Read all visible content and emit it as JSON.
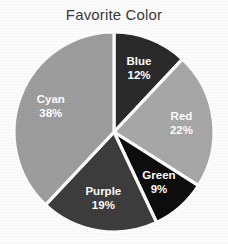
{
  "chart_data": {
    "type": "pie",
    "title": "Favorite Color",
    "xlabel": "",
    "ylabel": "",
    "legend": "none",
    "grid": false,
    "start_angle_deg": 0,
    "direction": "clockwise",
    "categories": [
      "Blue",
      "Red",
      "Green",
      "Purple",
      "Cyan"
    ],
    "values": [
      12,
      22,
      9,
      19,
      38
    ],
    "value_unit": "%",
    "slices": [
      {
        "label": "Blue",
        "value": 12,
        "value_text": "12%",
        "color": "#2a2a2a",
        "label_color": "#ffffff"
      },
      {
        "label": "Red",
        "value": 22,
        "value_text": "22%",
        "color": "#a8a8a8",
        "label_color": "#ffffff"
      },
      {
        "label": "Green",
        "value": 9,
        "value_text": "9%",
        "color": "#0d0d0d",
        "label_color": "#ffffff"
      },
      {
        "label": "Purple",
        "value": 19,
        "value_text": "19%",
        "color": "#3d3d3d",
        "label_color": "#ffffff"
      },
      {
        "label": "Cyan",
        "value": 38,
        "value_text": "38%",
        "color": "#9e9e9e",
        "label_color": "#ffffff"
      }
    ]
  },
  "style": {
    "background": "#fefefe",
    "title_color": "#3a3a3a",
    "slice_separator_color": "#ffffff"
  },
  "geometry": {
    "center_x": 114,
    "center_y": 132,
    "radius": 100,
    "label_radius_factor": 0.68
  }
}
